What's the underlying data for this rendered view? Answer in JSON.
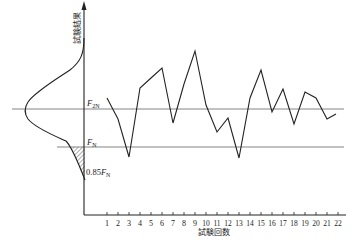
{
  "chart_data": {
    "type": "line",
    "title": "",
    "xlabel": "試験回数",
    "ylabel": "試験結果",
    "x": [
      1,
      2,
      3,
      4,
      5,
      6,
      7,
      8,
      9,
      10,
      11,
      12,
      13,
      14,
      15,
      16,
      17,
      18,
      19,
      20,
      21,
      22
    ],
    "tick_labels": [
      "1",
      "2",
      "3",
      "4",
      "5",
      "6",
      "7",
      "8",
      "9",
      "10",
      "11",
      "12",
      "13",
      "14",
      "15",
      "16",
      "17",
      "18",
      "19",
      "20",
      "21",
      "22"
    ],
    "series": [
      {
        "name": "試験結果",
        "values": [
          117,
          96,
          58,
          127,
          137,
          147,
          92,
          131,
          164,
          110,
          83,
          97,
          57,
          117,
          145,
          103,
          126,
          91,
          123,
          117,
          96,
          101
        ]
      }
    ],
    "y_units_note": "relative height above x-axis (axis unlabeled, no numeric ticks)",
    "ylim": [
      0,
      213
    ],
    "reference_lines": [
      {
        "label_main": "F",
        "label_sub": "2N",
        "value": 106
      },
      {
        "label_main": "F",
        "label_sub": "N",
        "value": 68
      }
    ],
    "annotations": [
      {
        "text_prefix": "0.85",
        "label_main": "F",
        "label_sub": "N",
        "value": 35,
        "note": "lower end of hatched tail region of distribution curve"
      }
    ],
    "distribution_curve": {
      "description": "bell-shaped frequency distribution drawn sideways on the left of the y-axis, centered at F2N, with hatched tail between FN and 0.85FN",
      "center_value": 106
    },
    "grid": false,
    "legend": "none"
  },
  "labels": {
    "y_axis": "試験結果",
    "x_axis": "試験回数",
    "f2n_main": "F",
    "f2n_sub": "2N",
    "fn_main": "F",
    "fn_sub": "N",
    "low_prefix": "0.85",
    "low_main": "F",
    "low_sub": "N"
  }
}
